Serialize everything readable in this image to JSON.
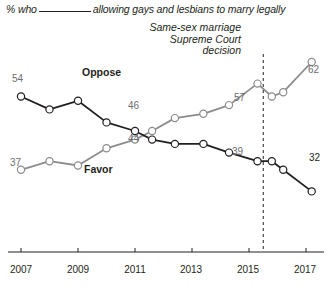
{
  "header": {
    "title_prefix": "% who",
    "title_suffix": "allowing gays and lesbians to marry legally",
    "annotation_lines": [
      "Same-sex marriage",
      "Supreme Court",
      "decision"
    ]
  },
  "series_labels": {
    "oppose": "Oppose",
    "favor": "Favor"
  },
  "colors": {
    "oppose": "#231f20",
    "favor": "#8c8c8c",
    "axis": "#231f20",
    "marker_fill": "#ffffff",
    "label_gray": "#6d6e71",
    "event_line": "#231f20"
  },
  "value_labels": {
    "oppose_start": "54",
    "oppose_mid": "46",
    "oppose_end": "32",
    "favor_start": "37",
    "favor_mid": "44",
    "favor_2015": "39",
    "favor_end": "62",
    "oppose_2015": "57"
  },
  "axis": {
    "ticks": [
      "2007",
      "2009",
      "2011",
      "2013",
      "2015",
      "2017"
    ]
  },
  "chart_data": {
    "type": "line",
    "xlabel": "",
    "ylabel": "",
    "xlim": [
      2006.6,
      2017.6
    ],
    "ylim": [
      20,
      70
    ],
    "grid": false,
    "legend": "inline-labels",
    "annotations": [
      {
        "text": "Same-sex marriage Supreme Court decision",
        "x": 2015.5,
        "type": "vertical-dashed-line"
      }
    ],
    "x_tick_labels": [
      "2007",
      "2009",
      "2011",
      "2013",
      "2015",
      "2017"
    ],
    "x_ticks": [
      2007,
      2009,
      2011,
      2013,
      2015,
      2017
    ],
    "series": [
      {
        "name": "Oppose",
        "color": "#231f20",
        "x": [
          2007.0,
          2008.0,
          2009.0,
          2010.0,
          2011.0,
          2011.6,
          2012.4,
          2013.4,
          2014.3,
          2015.3,
          2015.8,
          2016.2,
          2017.2
        ],
        "values": [
          54,
          51,
          53,
          48,
          46,
          44,
          43,
          43,
          41,
          39,
          39,
          37,
          32
        ],
        "labeled_points": [
          {
            "x": 2007.0,
            "value": 54
          },
          {
            "x": 2011.0,
            "value": 46
          },
          {
            "x": 2015.3,
            "value": 39
          },
          {
            "x": 2017.2,
            "value": 32
          }
        ]
      },
      {
        "name": "Favor",
        "color": "#8c8c8c",
        "x": [
          2007.0,
          2008.0,
          2009.0,
          2010.0,
          2011.0,
          2011.6,
          2012.4,
          2013.4,
          2014.3,
          2015.3,
          2015.8,
          2016.2,
          2017.2
        ],
        "values": [
          37,
          39,
          38,
          42,
          44,
          46,
          49,
          50,
          52,
          57,
          54,
          55,
          62
        ],
        "labeled_points": [
          {
            "x": 2007.0,
            "value": 37
          },
          {
            "x": 2011.0,
            "value": 44
          },
          {
            "x": 2015.3,
            "value": 57
          },
          {
            "x": 2017.2,
            "value": 62
          }
        ]
      }
    ]
  }
}
